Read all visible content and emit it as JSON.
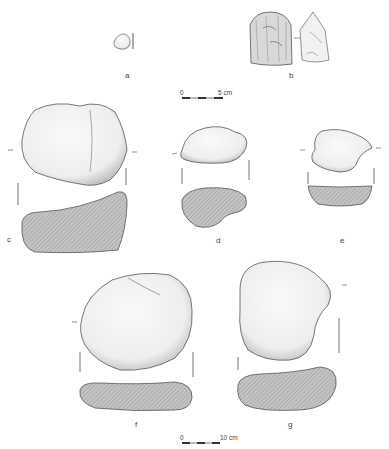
{
  "figure": {
    "labels": {
      "a": "a",
      "b": "b",
      "c": "c",
      "d": "d",
      "e": "e",
      "f": "f",
      "g": "g"
    },
    "scale_top": {
      "start": "0",
      "end": "5 cm"
    },
    "scale_bottom": {
      "start": "0",
      "end": "10 cm"
    },
    "colors": {
      "outline": "#555555",
      "section_fill": "#b5b5b5",
      "stone_fill": "#f4f4f4",
      "shade": "#cfcfcf"
    }
  }
}
